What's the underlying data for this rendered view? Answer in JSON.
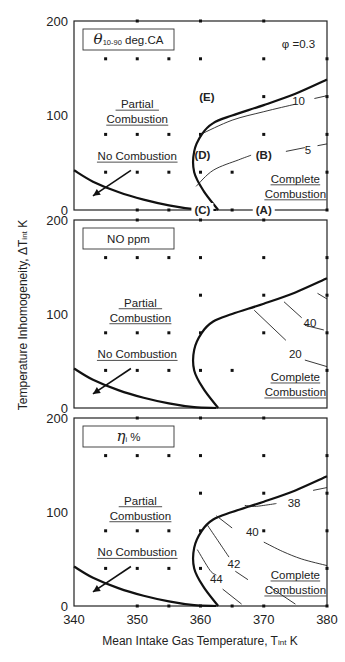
{
  "chart_data": {
    "type": "scatter",
    "xlabel": "Mean Intake Gas Temperature, T",
    "xlabel_sub": "int",
    "xlabel_unit": "K",
    "ylabel": "Temperature Inhomogeneity,  ΔT",
    "ylabel_sub": "int",
    "ylabel_unit": "K",
    "xlim": [
      340,
      380
    ],
    "x_ticks": [
      "340",
      "350",
      "360",
      "370",
      "380"
    ],
    "x_tick_values": [
      340,
      350,
      360,
      370,
      380
    ],
    "panels": [
      {
        "id": "theta",
        "title_symbol": "θ",
        "title_sub": "10-90",
        "title_rest": " deg.CA",
        "annotation": "φ =0.3",
        "ylim": [
          0,
          200
        ],
        "y_ticks": [
          "0",
          "100",
          "200"
        ],
        "y_tick_values": [
          0,
          100,
          200
        ],
        "regions": [
          {
            "label": [
              "Partial",
              "Combustion"
            ],
            "x": 350,
            "y": 112
          },
          {
            "label": [
              "No Combustion"
            ],
            "x": 350,
            "y": 57
          },
          {
            "label": [
              "Complete",
              "Combustion"
            ],
            "x": 375,
            "y": 33
          }
        ],
        "point_labels": [
          {
            "text": "(E)",
            "x": 361,
            "y": 120
          },
          {
            "text": "(D)",
            "x": 360.3,
            "y": 58
          },
          {
            "text": "(B)",
            "x": 370,
            "y": 58
          },
          {
            "text": "(C)",
            "x": 360.3,
            "y": 0
          },
          {
            "text": "(A)",
            "x": 370,
            "y": 0
          }
        ],
        "contours": [
          {
            "value": "10",
            "points": [
              [
                360,
                80
              ],
              [
                365,
                95
              ],
              [
                370,
                104
              ],
              [
                375,
                112
              ]
            ],
            "label_x": 375.5,
            "label_y": 115,
            "tail": [
              [
                378,
                118
              ],
              [
                380,
                121
              ]
            ]
          },
          {
            "value": "5",
            "points": [
              [
                359.3,
                25
              ],
              [
                362,
                42
              ],
              [
                366,
                53
              ],
              [
                368,
                58
              ]
            ],
            "label_x": 377,
            "label_y": 63,
            "tail": [
              [
                373.5,
                62
              ],
              [
                376.5,
                66
              ]
            ],
            "tail2": [
              [
                378.5,
                68
              ],
              [
                380,
                70
              ]
            ]
          }
        ],
        "grid_points": [
          [
            350,
            200
          ],
          [
            360,
            200
          ],
          [
            370,
            200
          ],
          [
            345,
            160
          ],
          [
            350,
            160
          ],
          [
            355,
            160
          ],
          [
            360,
            160
          ],
          [
            370,
            160
          ],
          [
            380,
            160
          ],
          [
            370,
            120
          ],
          [
            380,
            120
          ],
          [
            345,
            80
          ],
          [
            350,
            80
          ],
          [
            355,
            80
          ],
          [
            360,
            80
          ],
          [
            370,
            80
          ],
          [
            380,
            80
          ],
          [
            345,
            40
          ],
          [
            350,
            40
          ],
          [
            355,
            40
          ],
          [
            360,
            40
          ],
          [
            365,
            40
          ],
          [
            380,
            40
          ],
          [
            350,
            0
          ],
          [
            355,
            0
          ],
          [
            365,
            0
          ],
          [
            380,
            0
          ]
        ]
      },
      {
        "id": "no",
        "title_text": "NO  ppm",
        "ylim": [
          0,
          200
        ],
        "y_ticks": [
          "0",
          "100",
          "200"
        ],
        "y_tick_values": [
          0,
          100,
          200
        ],
        "regions": [
          {
            "label": [
              "Partial",
              "Combustion"
            ],
            "x": 350.5,
            "y": 112
          },
          {
            "label": [
              "No Combustion"
            ],
            "x": 350,
            "y": 57
          },
          {
            "label": [
              "Complete",
              "Combustion"
            ],
            "x": 375,
            "y": 33
          }
        ],
        "point_labels": [],
        "contour_labels": [
          {
            "text": "40",
            "x": 377.3,
            "y": 90
          },
          {
            "text": "20",
            "x": 375,
            "y": 57
          }
        ],
        "contour_segments": [
          [
            [
              378.5,
              122
            ],
            [
              380,
              116
            ]
          ],
          [
            [
              373.2,
              113
            ],
            [
              376,
              96
            ]
          ],
          [
            [
              376.5,
              88
            ],
            [
              379.5,
              83
            ]
          ],
          [
            [
              368.5,
              104
            ],
            [
              373.5,
              72
            ]
          ],
          [
            [
              376.5,
              51
            ],
            [
              380,
              44
            ]
          ]
        ],
        "grid_points": [
          [
            350,
            200
          ],
          [
            360,
            200
          ],
          [
            370,
            200
          ],
          [
            345,
            160
          ],
          [
            350,
            160
          ],
          [
            355,
            160
          ],
          [
            360,
            160
          ],
          [
            370,
            160
          ],
          [
            380,
            160
          ],
          [
            360,
            120
          ],
          [
            370,
            120
          ],
          [
            380,
            120
          ],
          [
            345,
            80
          ],
          [
            350,
            80
          ],
          [
            355,
            80
          ],
          [
            360,
            80
          ],
          [
            370,
            80
          ],
          [
            380,
            80
          ],
          [
            345,
            40
          ],
          [
            350,
            40
          ],
          [
            355,
            40
          ],
          [
            360,
            40
          ],
          [
            365,
            40
          ],
          [
            380,
            40
          ]
        ]
      },
      {
        "id": "eta",
        "title_symbol": "η",
        "title_sub": "i",
        "title_rest": "  %",
        "ylim": [
          0,
          200
        ],
        "y_ticks": [
          "0",
          "100",
          "200"
        ],
        "y_tick_values": [
          0,
          100,
          200
        ],
        "regions": [
          {
            "label": [
              "Partial",
              "Combustion"
            ],
            "x": 350.5,
            "y": 112
          },
          {
            "label": [
              "No Combustion"
            ],
            "x": 350,
            "y": 57
          },
          {
            "label": [
              "Complete",
              "Combustion"
            ],
            "x": 375,
            "y": 33
          }
        ],
        "point_labels": [],
        "contour_labels": [
          {
            "text": "38",
            "x": 374.8,
            "y": 110
          },
          {
            "text": "40",
            "x": 368.2,
            "y": 79
          },
          {
            "text": "42",
            "x": 365.3,
            "y": 45
          },
          {
            "text": "44",
            "x": 362.5,
            "y": 29
          }
        ],
        "contour_segments": [
          [
            [
              367,
              107
            ],
            [
              368.5,
              106
            ],
            [
              370,
              107
            ],
            [
              372,
              109
            ]
          ],
          [
            [
              377.8,
              123
            ],
            [
              380,
              126
            ]
          ],
          [
            [
              362.5,
              96
            ],
            [
              365,
              83
            ]
          ],
          [
            [
              370,
              68
            ],
            [
              373,
              58
            ],
            [
              376,
              50
            ],
            [
              380,
              43
            ]
          ],
          [
            [
              361,
              87
            ],
            [
              363,
              67
            ],
            [
              364.5,
              52
            ]
          ],
          [
            [
              365.5,
              37
            ],
            [
              367.5,
              28
            ]
          ],
          [
            [
              359.5,
              60
            ],
            [
              361.5,
              38
            ],
            [
              362.5,
              33
            ]
          ],
          [
            [
              363.5,
              18
            ],
            [
              366.5,
              2
            ]
          ],
          [
            [
              371,
              20
            ],
            [
              375,
              2
            ]
          ]
        ],
        "grid_points": [
          [
            350,
            200
          ],
          [
            360,
            200
          ],
          [
            370,
            200
          ],
          [
            345,
            160
          ],
          [
            350,
            160
          ],
          [
            355,
            160
          ],
          [
            360,
            160
          ],
          [
            370,
            160
          ],
          [
            380,
            160
          ],
          [
            360,
            120
          ],
          [
            370,
            120
          ],
          [
            380,
            120
          ],
          [
            345,
            80
          ],
          [
            350,
            80
          ],
          [
            355,
            80
          ],
          [
            360,
            80
          ],
          [
            370,
            80
          ],
          [
            380,
            80
          ],
          [
            345,
            40
          ],
          [
            350,
            40
          ],
          [
            355,
            40
          ],
          [
            360,
            40
          ],
          [
            380,
            40
          ],
          [
            350,
            0
          ],
          [
            355,
            0
          ],
          [
            360,
            0
          ],
          [
            365,
            0
          ],
          [
            370,
            0
          ],
          [
            380,
            0
          ]
        ]
      }
    ],
    "boundaries": {
      "no_combustion_curve": [
        [
          340,
          42
        ],
        [
          343,
          30
        ],
        [
          347,
          19
        ],
        [
          351,
          11
        ],
        [
          355,
          5
        ],
        [
          359,
          1
        ],
        [
          362.5,
          0
        ]
      ],
      "complete_combustion_curve": [
        [
          362.8,
          0
        ],
        [
          360.5,
          20
        ],
        [
          359,
          40
        ],
        [
          359,
          62
        ],
        [
          360.2,
          80
        ],
        [
          362,
          92
        ],
        [
          365,
          100
        ],
        [
          370,
          111
        ],
        [
          375,
          123
        ],
        [
          380,
          138
        ]
      ]
    },
    "arrow": {
      "from": [
        349,
        42
      ],
      "to": [
        343,
        15
      ]
    }
  }
}
